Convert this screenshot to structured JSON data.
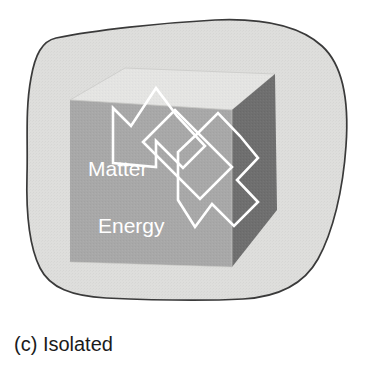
{
  "figure": {
    "caption": "(c) Isolated",
    "type": "thermodynamic-system-diagram",
    "system_labels": {
      "matter": "Matter",
      "energy": "Energy"
    },
    "meaning": "Isolated system: neither matter nor energy can cross the boundary",
    "colors": {
      "page_background": "#ffffff",
      "surroundings_fill": "#dededc",
      "surroundings_stroke": "#3a3a3a",
      "cube_front": "#a8a8a8",
      "cube_top": "#e3e3e1",
      "cube_side": "#6f6f6f",
      "arrow_stroke": "#ffffff",
      "label_text": "#ffffff",
      "caption_text": "#1b1b1b"
    },
    "elements": {
      "surroundings_name": "surroundings-boundary",
      "cube_name": "system-cube",
      "arrows_name": "blocked-transfer-arrows"
    }
  }
}
